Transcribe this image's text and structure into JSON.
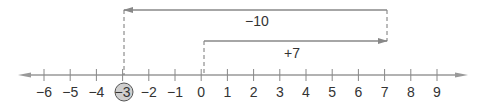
{
  "number_line": {
    "min": -6,
    "max": 9,
    "ticks": [
      "−6",
      "−5",
      "−4",
      "−3",
      "−2",
      "−1",
      "0",
      "1",
      "2",
      "3",
      "4",
      "5",
      "6",
      "7",
      "8",
      "9"
    ],
    "highlighted": "−3",
    "highlight_color": "#cccccc",
    "line_color": "#888888"
  },
  "moves": [
    {
      "label": "+7",
      "from": 0,
      "to": 7
    },
    {
      "label": "−10",
      "from": 7,
      "to": -3
    }
  ]
}
